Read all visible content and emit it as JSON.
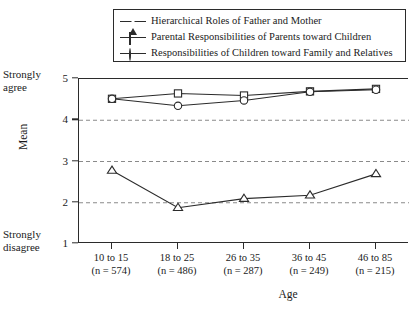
{
  "chart_data": {
    "type": "line",
    "title": "",
    "xlabel": "Age",
    "ylabel": "Mean",
    "categories": [
      "10 to 15",
      "18 to 25",
      "26 to 35",
      "36 to 45",
      "46 to 85"
    ],
    "category_sublabels": [
      "(n = 574)",
      "(n = 486)",
      "(n = 287)",
      "(n = 249)",
      "(n = 215)"
    ],
    "ylim": [
      1,
      5
    ],
    "yticks": [
      1,
      2,
      3,
      4,
      5
    ],
    "ytick_labels": [
      "1",
      "2",
      "3",
      "4",
      "5"
    ],
    "y_axis_anchor_high": "Strongly\nagree",
    "y_axis_anchor_high_line1": "Strongly",
    "y_axis_anchor_high_line2": "agree",
    "y_axis_anchor_low_line1": "Strongly",
    "y_axis_anchor_low_line2": "disagree",
    "grid": "horizontal-dashed-at-2-3-4",
    "legend_position": "top",
    "series": [
      {
        "name": "Hierarchical Roles of Father and Mother",
        "marker": "triangle",
        "values": [
          2.78,
          1.88,
          2.1,
          2.18,
          2.7
        ]
      },
      {
        "name": "Parental Responsibilities of Parents toward Children",
        "marker": "square",
        "values": [
          4.52,
          4.65,
          4.6,
          4.7,
          4.76
        ]
      },
      {
        "name": "Responsibilities of Children toward Family and Relatives",
        "marker": "circle",
        "values": [
          4.52,
          4.35,
          4.48,
          4.69,
          4.74
        ]
      }
    ],
    "colors": {
      "line": "#2b2b2b",
      "marker_fill": "#ffffff",
      "grid": "#8a8a8a",
      "background": "#ffffff"
    }
  }
}
